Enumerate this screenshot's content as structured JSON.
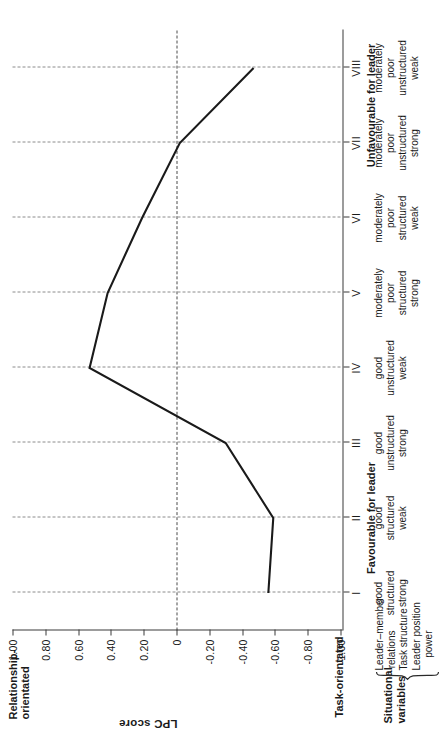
{
  "chart_data": {
    "type": "line",
    "title": "",
    "ylabel": "LPC score",
    "xlabel": "",
    "ylim": [
      -1.0,
      1.0
    ],
    "grid": true,
    "legend": "none",
    "orientation": "rotated-90",
    "categories": [
      "I",
      "II",
      "III",
      "IV",
      "V",
      "VI",
      "VII",
      "VIII"
    ],
    "values": [
      -0.56,
      -0.59,
      -0.3,
      0.53,
      0.42,
      0.21,
      -0.02,
      -0.47
    ],
    "ytick_labels": [
      "1.00",
      "0.80",
      "0.60",
      "0.40",
      "0.20",
      "0",
      "-0.20",
      "-0.40",
      "-0.60",
      "-0.80",
      "-1.00"
    ],
    "ytick_values": [
      1.0,
      0.8,
      0.6,
      0.4,
      0.2,
      0,
      -0.2,
      -0.4,
      -0.6,
      -0.8,
      -1.0
    ],
    "axis_end_labels": {
      "top": "Relationship-\norientated",
      "bottom": "Task-orientated"
    },
    "group_headers": [
      {
        "label": "Favourable for leader",
        "categories": [
          "I",
          "II",
          "III"
        ]
      },
      {
        "label": "Unfavourable for leader",
        "categories": [
          "VII",
          "VIII"
        ]
      }
    ],
    "situational_variables": {
      "title": "Situational\nvariables",
      "rows": [
        "Leader–member\nrelations",
        "Task structure",
        "Leader position\npower"
      ]
    },
    "category_table": [
      {
        "roman": "I",
        "relations": "good",
        "structure": "structured",
        "power": "strong"
      },
      {
        "roman": "II",
        "relations": "good",
        "structure": "structured",
        "power": "weak"
      },
      {
        "roman": "III",
        "relations": "good",
        "structure": "unstructured",
        "power": "strong"
      },
      {
        "roman": "IV",
        "relations": "good",
        "structure": "unstructured",
        "power": "weak"
      },
      {
        "roman": "V",
        "relations": "moderately\npoor",
        "structure": "structured",
        "power": "strong"
      },
      {
        "roman": "VI",
        "relations": "moderately\npoor",
        "structure": "structured",
        "power": "weak"
      },
      {
        "roman": "VII",
        "relations": "moderately\npoor",
        "structure": "unstructured",
        "power": "strong"
      },
      {
        "roman": "VIII",
        "relations": "moderately\npoor",
        "structure": "unstructured",
        "power": "weak"
      }
    ]
  },
  "labels": {
    "relationship_orientated_line1": "Relationship-",
    "relationship_orientated_line2": "orientated",
    "task_orientated": "Task-orientated",
    "value_axis_title": "LPC score",
    "favourable_head": "Favourable for leader",
    "unfavourable_head": "Unfavourable for leader",
    "sitvar_title_line1": "Situational",
    "sitvar_title_line2": "variables",
    "sitvar_row1_line1": "Leader–member",
    "sitvar_row1_line2": "relations",
    "sitvar_row2": "Task structure",
    "sitvar_row3_line1": "Leader position",
    "sitvar_row3_line2": "power"
  },
  "colors": {
    "series": "#1a1a1a",
    "axis": "#3a3a3a",
    "gridline": "#8c8c8c",
    "zero_line": "#4a4a4a",
    "background": "#ffffff"
  }
}
